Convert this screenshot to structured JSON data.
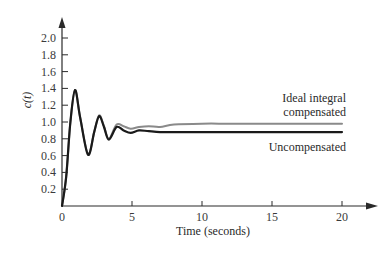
{
  "chart_data": {
    "type": "line",
    "title": "",
    "xlabel": "Time (seconds)",
    "ylabel": "c(t)",
    "xlim": [
      0,
      20
    ],
    "ylim": [
      0,
      2.0
    ],
    "grid": false,
    "x_ticks": [
      0,
      5,
      10,
      15,
      20
    ],
    "x_tick_labels": [
      "0",
      "5",
      "10",
      "15",
      "20"
    ],
    "y_ticks": [
      0.2,
      0.4,
      0.6,
      0.8,
      1.0,
      1.2,
      1.4,
      1.6,
      1.8,
      2.0
    ],
    "y_tick_labels": [
      "0.2",
      "0.4",
      "0.6",
      "0.8",
      "1.0",
      "1.2",
      "1.4",
      "1.6",
      "1.8",
      "2.0"
    ],
    "series": [
      {
        "name": "Ideal integral compensated",
        "color": "#8a8a8a",
        "x": [
          0,
          0.3,
          0.6,
          0.93,
          1.3,
          1.86,
          2.3,
          2.65,
          3.0,
          3.35,
          3.9,
          4.4,
          4.9,
          5.5,
          6.2,
          7.0,
          8.0,
          10.0,
          12.0,
          15.0,
          20.0
        ],
        "values": [
          0,
          0.35,
          1.0,
          1.38,
          1.05,
          0.62,
          0.88,
          1.08,
          0.95,
          0.8,
          0.97,
          0.95,
          0.92,
          0.94,
          0.95,
          0.94,
          0.97,
          0.98,
          0.98,
          0.98,
          0.98
        ]
      },
      {
        "name": "Uncompensated",
        "color": "#1a1a1a",
        "x": [
          0,
          0.3,
          0.6,
          0.93,
          1.3,
          1.86,
          2.3,
          2.65,
          3.0,
          3.35,
          3.9,
          4.4,
          4.9,
          5.5,
          6.2,
          7.0,
          8.0,
          10.0,
          12.0,
          15.0,
          20.0
        ],
        "values": [
          0,
          0.35,
          1.0,
          1.38,
          1.05,
          0.61,
          0.88,
          1.07,
          0.94,
          0.79,
          0.94,
          0.9,
          0.87,
          0.9,
          0.89,
          0.88,
          0.88,
          0.88,
          0.88,
          0.88,
          0.88
        ]
      }
    ],
    "annotations": [
      {
        "text_lines": [
          "Ideal integral",
          "compensated"
        ],
        "target_series": "Ideal integral compensated"
      },
      {
        "text_lines": [
          "Uncompensated"
        ],
        "target_series": "Uncompensated"
      }
    ],
    "legend_position": "inline-annotations-right"
  },
  "labels": {
    "xlabel": "Time (seconds)",
    "ylabel": "c(t)",
    "annot_ideal_1": "Ideal integral",
    "annot_ideal_2": "compensated",
    "annot_uncomp": "Uncompensated"
  }
}
